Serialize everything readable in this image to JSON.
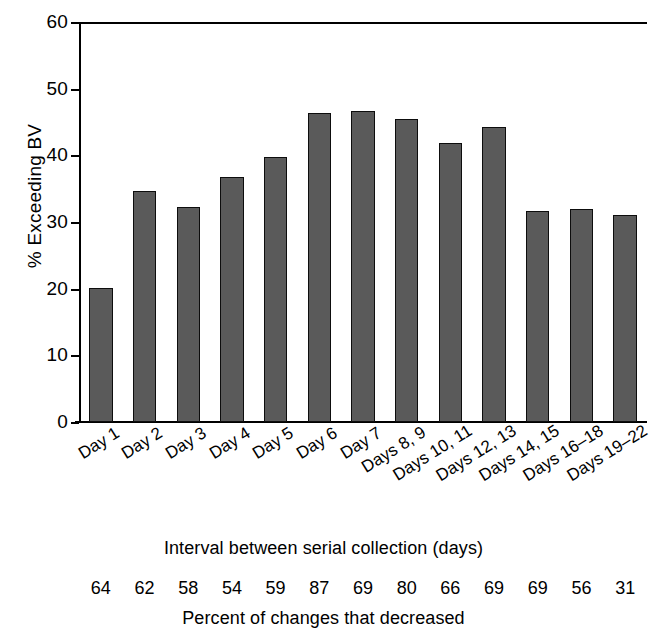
{
  "chart_data": {
    "type": "bar",
    "title": "",
    "xlabel": "Interval between serial collection (days)",
    "ylabel": "% Exceeding BV",
    "ylim": [
      0,
      60
    ],
    "yticks": [
      0,
      10,
      20,
      30,
      40,
      50,
      60
    ],
    "ytick_labels": [
      "0",
      "10",
      "20",
      "30",
      "40",
      "50",
      "60"
    ],
    "grid": false,
    "legend": "none",
    "categories": [
      "Day 1",
      "Day 2",
      "Day 3",
      "Day 4",
      "Day 5",
      "Day 6",
      "Day 7",
      "Days 8, 9",
      "Days 10, 11",
      "Days 12, 13",
      "Days 14, 15",
      "Days 16–18",
      "Days 19–22"
    ],
    "values": [
      20.1,
      34.6,
      32.3,
      36.7,
      39.8,
      46.4,
      46.7,
      45.5,
      41.9,
      44.3,
      31.7,
      32.0,
      31.0
    ],
    "bar_color": "#5a5a5a",
    "bar_edge_color": "#0d0d0d",
    "secondary_row": {
      "caption": "Percent of changes that decreased",
      "values": [
        64,
        62,
        58,
        54,
        59,
        87,
        69,
        80,
        66,
        69,
        69,
        56,
        31
      ]
    }
  },
  "figure": {
    "y_axis_title": "% Exceeding BV",
    "x_axis_title": "Interval between serial collection (days)",
    "bottom_caption": "Percent of changes that decreased"
  }
}
